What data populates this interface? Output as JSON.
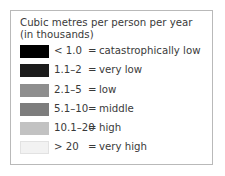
{
  "legend": {
    "title": "Cubic metres per person per year\n(in thousands)",
    "title_line1": "Cubic metres per person per year",
    "title_line2": "(in thousands)",
    "equals": "=",
    "frame_border_color": "#b9b9b9",
    "text_color": "#3a3a3a",
    "entries": [
      {
        "range": "< 1.0",
        "equals": "=",
        "description": "catastrophically low",
        "color": "#000000",
        "outlined": false
      },
      {
        "range": "1.1–2",
        "equals": "=",
        "description": "very low",
        "color": "#1c1c1c",
        "outlined": false
      },
      {
        "range": "2.1–5",
        "equals": "=",
        "description": "low",
        "color": "#8e8e8e",
        "outlined": false
      },
      {
        "range": "5.1–10",
        "equals": "=",
        "description": "middle",
        "color": "#7d7d7d",
        "outlined": false
      },
      {
        "range": "10.1–20",
        "equals": "=",
        "description": "high",
        "color": "#c2c2c2",
        "outlined": false
      },
      {
        "range": "> 20",
        "equals": "=",
        "description": "very high",
        "color": "#f2f2f2",
        "outlined": true
      }
    ]
  }
}
